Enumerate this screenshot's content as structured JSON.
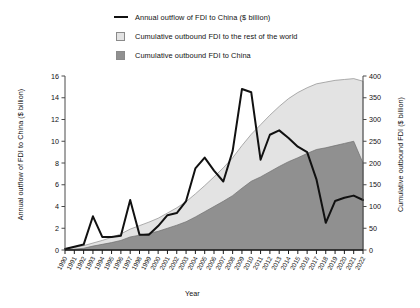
{
  "legend": {
    "items": [
      {
        "marker": "line",
        "label": "Annual outflow of FDI to China ($ billion)",
        "color": "#111111"
      },
      {
        "marker": "swatch",
        "label": "Cumulative outbound FDI to the rest of the world",
        "color": "#e3e3e3"
      },
      {
        "marker": "swatch",
        "label": "Cumulative outbound FDI to China",
        "color": "#909090"
      }
    ]
  },
  "axes": {
    "x_title": "Year",
    "y_left_title": "Annual outflow of FDI to China ($ billion)",
    "y_right_title": "Cumulative outbound FDI ($ billion)"
  },
  "chart_data": {
    "type": "line",
    "title": "",
    "xlabel": "Year",
    "ylabel": "Annual outflow of FDI to China ($ billion)",
    "y2label": "Cumulative outbound FDI ($ billion)",
    "ylim": [
      0,
      16
    ],
    "y2lim": [
      0,
      400
    ],
    "yticks": [
      0,
      2,
      4,
      6,
      8,
      10,
      12,
      14,
      16
    ],
    "y2ticks": [
      0,
      50,
      100,
      150,
      200,
      250,
      300,
      350,
      400
    ],
    "grid": false,
    "legend_position": "top",
    "categories": [
      "1990",
      "1991",
      "1992",
      "1993",
      "1994",
      "1995",
      "1996",
      "1997",
      "1998",
      "1999",
      "2000",
      "2001",
      "2002",
      "2003",
      "2004",
      "2005",
      "2006",
      "2007",
      "2008",
      "2009",
      "2010",
      "2011",
      "2012",
      "2013",
      "2014",
      "2015",
      "2016",
      "2017",
      "2018",
      "2019",
      "2020",
      "2021",
      "2022"
    ],
    "series": [
      {
        "name": "Annual outflow of FDI to China ($ billion)",
        "type": "line",
        "axis": "left",
        "color": "#111111",
        "values": [
          0.1,
          0.3,
          0.5,
          3.1,
          1.2,
          1.2,
          1.3,
          4.6,
          1.4,
          1.4,
          2.2,
          3.2,
          3.4,
          4.5,
          7.5,
          8.5,
          7.3,
          6.3,
          9.1,
          14.8,
          14.5,
          8.3,
          10.6,
          11.0,
          10.3,
          9.5,
          9.0,
          6.5,
          2.5,
          4.5,
          4.8,
          5.0,
          4.6
        ]
      },
      {
        "name": "Cumulative outbound FDI to China",
        "type": "area",
        "axis": "right",
        "color": "#909090",
        "values": [
          1,
          2,
          4,
          9,
          13,
          17,
          22,
          30,
          34,
          38,
          43,
          50,
          57,
          65,
          76,
          88,
          100,
          112,
          125,
          142,
          158,
          168,
          180,
          192,
          203,
          212,
          222,
          231,
          235,
          240,
          245,
          250,
          200
        ]
      },
      {
        "name": "Cumulative outbound FDI to the rest of the world",
        "type": "area",
        "axis": "right",
        "color": "#e3e3e3",
        "values": [
          3,
          6,
          10,
          16,
          22,
          29,
          37,
          48,
          56,
          64,
          73,
          85,
          97,
          111,
          129,
          148,
          168,
          189,
          212,
          240,
          266,
          288,
          310,
          330,
          348,
          362,
          373,
          382,
          386,
          390,
          392,
          394,
          388
        ]
      }
    ]
  }
}
